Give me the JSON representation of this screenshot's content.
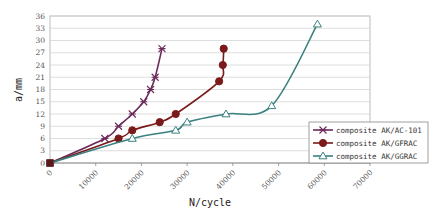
{
  "chart_data": {
    "type": "line",
    "title": "",
    "xlabel": "N/cycle",
    "ylabel": "a/mm",
    "xlim": [
      0,
      70000
    ],
    "ylim": [
      0,
      36
    ],
    "x_ticks": [
      0,
      10000,
      20000,
      30000,
      40000,
      50000,
      60000,
      70000
    ],
    "y_ticks": [
      0,
      3,
      6,
      9,
      12,
      15,
      18,
      21,
      24,
      27,
      30,
      33,
      36
    ],
    "grid": "horizontal",
    "legend_position": "lower right",
    "series": [
      {
        "name": "composite AK/AC-101",
        "color": "#6b2a5a",
        "marker": "asterisk",
        "x": [
          0,
          12000,
          15000,
          18000,
          20500,
          22000,
          23000,
          24500
        ],
        "y": [
          0,
          6,
          9,
          12,
          15,
          18,
          21,
          28
        ]
      },
      {
        "name": "composite AK/GFRAC",
        "color": "#7a1a1a",
        "marker": "circle",
        "x": [
          0,
          15000,
          18000,
          24000,
          27500,
          37000,
          37800,
          38000
        ],
        "y": [
          0,
          6,
          8,
          10,
          12,
          20,
          24,
          28
        ]
      },
      {
        "name": "composite AK/GGRAC",
        "color": "#3a8080",
        "marker": "triangle",
        "x": [
          0,
          18000,
          27500,
          30000,
          38500,
          48500,
          58500
        ],
        "y": [
          0,
          6,
          8,
          10,
          12,
          14,
          34
        ]
      }
    ]
  }
}
